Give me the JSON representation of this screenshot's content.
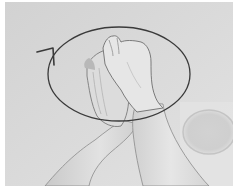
{
  "image": {
    "kind": "photograph",
    "style": "grayscale",
    "subject": "two hands clasped together with fingers interlocked, raised forearms",
    "annotation": {
      "shape": "ellipse",
      "direction": "counter-clockwise rotation arrow",
      "stroke_color": "#3a3a3a"
    },
    "colors": {
      "background": "#d6d6d6",
      "skin_light": "#e4e4e4",
      "skin_shadow": "#bdbdbd",
      "outline": "#5a5a5a",
      "border": "#ffffff"
    }
  }
}
